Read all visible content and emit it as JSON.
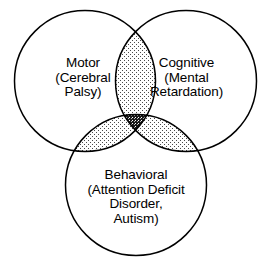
{
  "diagram": {
    "type": "venn-3-circle",
    "background_color": "#ffffff",
    "stroke_color": "#000000",
    "fill_color": "#ffffff",
    "pair_intersection_shade": "#d8d8d8",
    "triple_intersection_shade": "#2b2b2b",
    "sets": [
      {
        "id": "motor",
        "name": "Motor",
        "lines": [
          "Motor",
          "(Cerebral",
          "Palsy)"
        ],
        "line1": "Motor",
        "line2": "(Cerebral",
        "line3": "Palsy)",
        "position": "left"
      },
      {
        "id": "cognitive",
        "name": "Cognitive",
        "lines": [
          "Cognitive",
          "(Mental",
          "Retardation)"
        ],
        "line1": "Cognitive",
        "line2": "(Mental",
        "line3": "Retardation)",
        "position": "right"
      },
      {
        "id": "behavioral",
        "name": "Behavioral",
        "lines": [
          "Behavioral",
          "(Attention Deficit",
          "Disorder,",
          "Autism)"
        ],
        "line1": "Behavioral",
        "line2": "(Attention Deficit",
        "line3": "Disorder,",
        "line4": "Autism)",
        "position": "bottom"
      }
    ]
  }
}
